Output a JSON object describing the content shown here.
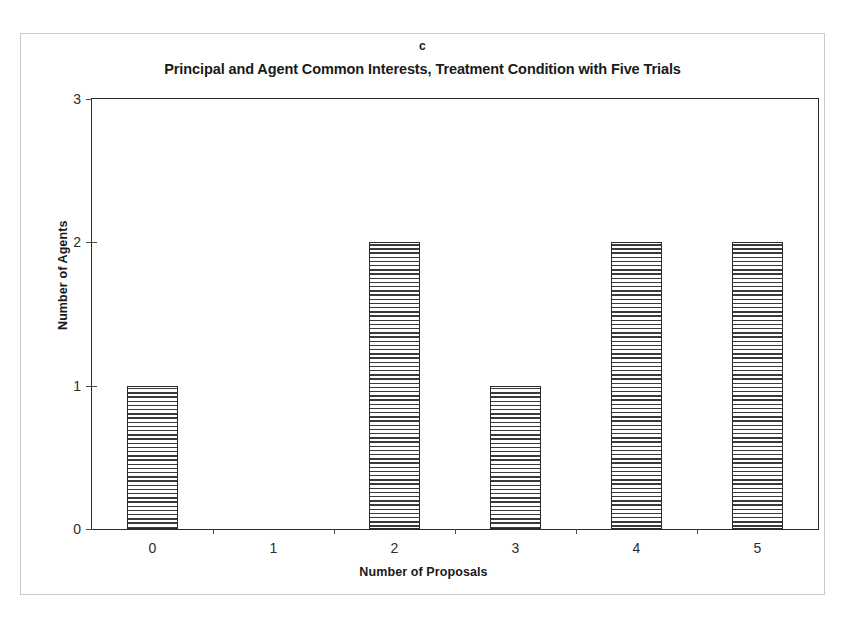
{
  "figure": {
    "panel_letter": "c",
    "title": "Principal and Agent Common Interests, Treatment Condition with Five Trials"
  },
  "chart_data": {
    "type": "bar",
    "title": "Principal and Agent Common Interests, Treatment Condition with Five Trials",
    "panel_label": "c",
    "categories": [
      "0",
      "1",
      "2",
      "3",
      "4",
      "5"
    ],
    "values": [
      1,
      0,
      2,
      1,
      2,
      2
    ],
    "xlabel": "Number of Proposals",
    "ylabel": "Number of Agents",
    "ylim": [
      0,
      3
    ],
    "ytick_labels": [
      "0",
      "1",
      "2",
      "3"
    ],
    "ytick_values": [
      0,
      1,
      2,
      3
    ],
    "xtick_labels": [
      "0",
      "1",
      "2",
      "3",
      "4",
      "5"
    ],
    "grid": false,
    "legend": null,
    "bar_fill": "horizontal-line-hatch",
    "bar_edge_color": "#2b2b2b",
    "bar_hatch_color": "#3a3a3a",
    "background_color": "#ffffff"
  },
  "axes": {
    "y_title": "Number of Agents",
    "x_title": "Number of Proposals",
    "y_labels": [
      "3",
      "2",
      "1",
      "0"
    ],
    "x_labels": [
      "0",
      "1",
      "2",
      "3",
      "4",
      "5"
    ]
  }
}
